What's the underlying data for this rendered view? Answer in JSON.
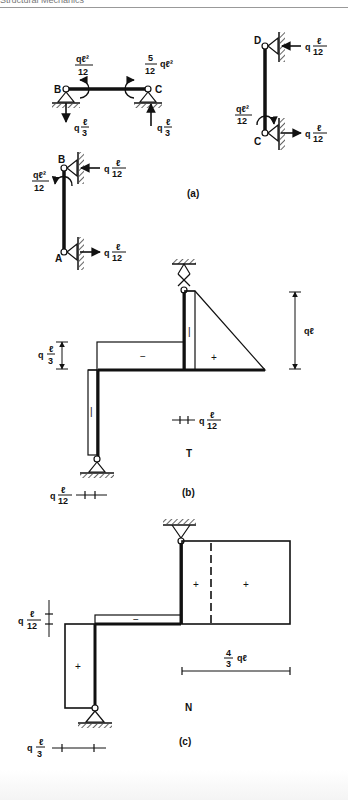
{
  "header": {
    "title": "Structural Mechanics"
  },
  "figure_a": {
    "caption": "(a)",
    "beam_bc": {
      "node_b": "B",
      "node_c": "C",
      "moment_b": {
        "num": "qℓ²",
        "den": "12"
      },
      "moment_c": {
        "coef_num": "5",
        "coef_den": "12",
        "tail": "qℓ²"
      },
      "reaction_b": {
        "q": "q",
        "num": "ℓ",
        "den": "3"
      },
      "reaction_c": {
        "q": "q",
        "num": "ℓ",
        "den": "3"
      }
    },
    "column_dc": {
      "node_d": "D",
      "node_c": "C",
      "force_d": {
        "q": "q",
        "num": "ℓ",
        "den": "12"
      },
      "force_c": {
        "q": "q",
        "num": "ℓ",
        "den": "12"
      },
      "moment_c": {
        "num": "qℓ²",
        "den": "12"
      }
    },
    "column_ab": {
      "node_b": "B",
      "node_a": "A",
      "force_b": {
        "q": "q",
        "num": "ℓ",
        "den": "12"
      },
      "force_a": {
        "q": "q",
        "num": "ℓ",
        "den": "12"
      },
      "moment_b": {
        "num": "qℓ²",
        "den": "12"
      }
    }
  },
  "figure_b": {
    "caption": "(b)",
    "diagram_label": "T",
    "signs": {
      "beam": "−",
      "triangle": "+",
      "col_right": "|",
      "col_left": "|"
    },
    "dim_beam": {
      "q": "q",
      "num": "ℓ",
      "den": "3"
    },
    "dim_height": "qℓ",
    "scale_right": {
      "q": "q",
      "num": "ℓ",
      "den": "12"
    },
    "scale_left": {
      "q": "q",
      "num": "ℓ",
      "den": "12"
    }
  },
  "figure_c": {
    "caption": "(c)",
    "diagram_label": "N",
    "signs": {
      "beam": "−",
      "col_left": "+",
      "rect_a": "+",
      "rect_b": "+"
    },
    "dim_beam": {
      "q": "q",
      "num": "ℓ",
      "den": "12"
    },
    "dim_width": {
      "num": "4",
      "den": "3",
      "tail": "qℓ"
    },
    "scale_bottom": {
      "q": "q",
      "num": "ℓ",
      "den": "3"
    }
  }
}
